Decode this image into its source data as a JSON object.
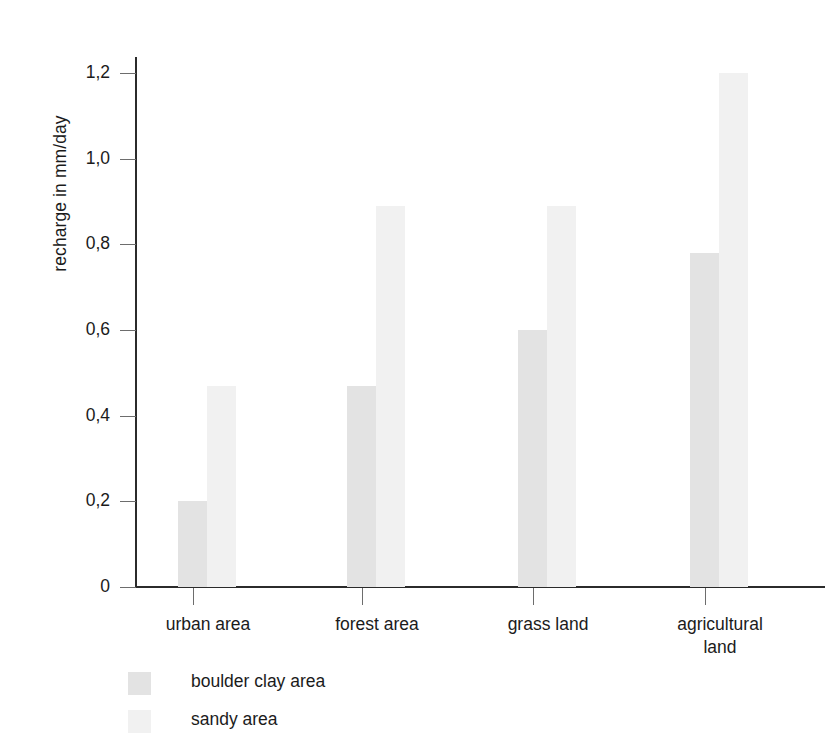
{
  "chart_data": {
    "type": "bar",
    "title": "",
    "xlabel": "",
    "ylabel": "recharge in mm/day",
    "ylim": [
      0,
      1.25
    ],
    "ytick_values": [
      0,
      0.2,
      0.4,
      0.6,
      0.8,
      1.0,
      1.2
    ],
    "ytick_labels": [
      "0",
      "0,2",
      "0,4",
      "0,6",
      "0,8",
      "1,0",
      "1,2"
    ],
    "grid": false,
    "legend_position": "below-left",
    "categories": [
      "urban area",
      "forest area",
      "grass land",
      "agricultural land"
    ],
    "category_label_lines": [
      [
        "urban area"
      ],
      [
        "forest area"
      ],
      [
        "grass land"
      ],
      [
        "agricultural",
        "land"
      ]
    ],
    "series": [
      {
        "name": "boulder clay area",
        "color": "#e3e3e3",
        "values": [
          0.2,
          0.47,
          0.6,
          0.78
        ]
      },
      {
        "name": "sandy area",
        "color": "#f1f1f1",
        "values": [
          0.47,
          0.89,
          0.89,
          1.2
        ]
      }
    ]
  },
  "axis": {
    "axis_color": "#2b2b2b",
    "tick_color": "#6d6d6d"
  },
  "legend": {
    "items": [
      {
        "label": "boulder clay area",
        "color": "#e3e3e3"
      },
      {
        "label": "sandy area",
        "color": "#f1f1f1"
      }
    ]
  }
}
